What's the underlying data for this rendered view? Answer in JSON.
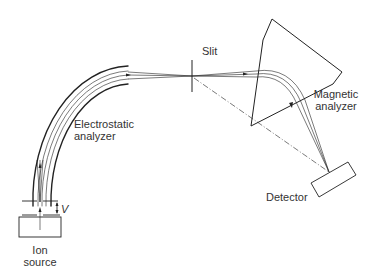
{
  "diagram": {
    "labels": {
      "electrostatic_line1": "Electrostatic",
      "electrostatic_line2": "analyzer",
      "slit": "Slit",
      "magnetic_line1": "Magnetic",
      "magnetic_line2": "analyzer",
      "detector": "Detector",
      "ion_line1": "Ion",
      "ion_line2": "source",
      "voltage": "V"
    },
    "colors": {
      "stroke": "#222222",
      "text": "#333333",
      "background": "#ffffff"
    }
  }
}
